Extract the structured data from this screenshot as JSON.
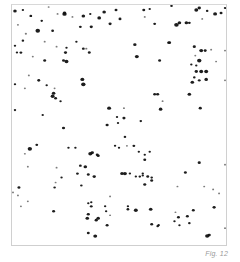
{
  "figure": {
    "caption": "Fig. 12",
    "colors": {
      "background": "#ffffff",
      "dots": "#111111",
      "frame": "#d0d0d0",
      "caption": "#9a9a9a"
    }
  },
  "dots": [
    [
      14,
      10,
      1.8
    ],
    [
      22,
      9,
      1.2
    ],
    [
      48,
      6,
      1.0
    ],
    [
      30,
      15,
      1.4
    ],
    [
      57,
      13,
      1.0
    ],
    [
      64,
      13,
      2.2
    ],
    [
      72,
      16,
      1.0
    ],
    [
      41,
      20,
      1.3
    ],
    [
      64,
      12,
      1.6
    ],
    [
      83,
      15,
      1.8
    ],
    [
      90,
      13,
      1.2
    ],
    [
      99,
      17,
      1.9
    ],
    [
      104,
      11,
      1.8
    ],
    [
      116,
      9,
      1.5
    ],
    [
      110,
      23,
      1.6
    ],
    [
      80,
      26,
      1.4
    ],
    [
      91,
      26,
      1.6
    ],
    [
      120,
      18,
      1.5
    ],
    [
      37,
      30,
      2.3
    ],
    [
      17,
      24,
      1.0
    ],
    [
      25,
      33,
      1.1
    ],
    [
      14,
      45,
      1.2
    ],
    [
      22,
      40,
      1.3
    ],
    [
      52,
      30,
      1.4
    ],
    [
      56,
      46,
      1.0
    ],
    [
      66,
      47,
      1.2
    ],
    [
      65,
      52,
      1.6
    ],
    [
      76,
      41,
      1.2
    ],
    [
      83,
      48,
      1.4
    ],
    [
      89,
      52,
      1.5
    ],
    [
      86,
      48,
      1.1
    ],
    [
      44,
      41,
      1.0
    ],
    [
      20,
      52,
      1.4
    ],
    [
      16,
      52,
      1.2
    ],
    [
      32,
      56,
      1.0
    ],
    [
      44,
      60,
      1.5
    ],
    [
      66,
      61,
      2.0
    ],
    [
      63,
      60,
      1.5
    ],
    [
      28,
      75,
      1.0
    ],
    [
      38,
      80,
      1.5
    ],
    [
      46,
      85,
      1.2
    ],
    [
      54,
      88,
      1.0
    ],
    [
      52,
      96,
      2.0
    ],
    [
      55,
      98,
      1.5
    ],
    [
      82,
      79,
      2.0
    ],
    [
      83,
      84,
      2.2
    ],
    [
      14,
      84,
      1.2
    ],
    [
      24,
      88,
      1.0
    ],
    [
      53,
      93,
      1.8
    ],
    [
      60,
      101,
      1.2
    ],
    [
      14,
      110,
      1.2
    ],
    [
      42,
      115,
      1.2
    ],
    [
      109,
      108,
      2.0
    ],
    [
      117,
      117,
      1.2
    ],
    [
      63,
      128,
      1.6
    ],
    [
      118,
      123,
      1.2
    ],
    [
      107,
      125,
      1.6
    ],
    [
      144,
      9,
      1.5
    ],
    [
      150,
      8,
      1.2
    ],
    [
      172,
      5,
      1.3
    ],
    [
      197,
      9,
      2.0
    ],
    [
      200,
      7,
      1.7
    ],
    [
      208,
      10,
      1.3
    ],
    [
      216,
      13,
      2.0
    ],
    [
      222,
      12,
      1.5
    ],
    [
      226,
      7,
      1.2
    ],
    [
      145,
      16,
      1.0
    ],
    [
      155,
      23,
      1.4
    ],
    [
      177,
      24,
      2.3
    ],
    [
      180,
      22,
      1.8
    ],
    [
      187,
      22,
      1.8
    ],
    [
      190,
      22,
      1.4
    ],
    [
      203,
      18,
      1.0
    ],
    [
      135,
      44,
      1.7
    ],
    [
      169,
      42,
      1.4
    ],
    [
      170,
      42,
      1.6
    ],
    [
      195,
      46,
      1.6
    ],
    [
      202,
      50,
      2.0
    ],
    [
      206,
      50,
      1.5
    ],
    [
      196,
      55,
      1.0
    ],
    [
      212,
      49,
      1.0
    ],
    [
      137,
      56,
      2.0
    ],
    [
      160,
      60,
      1.5
    ],
    [
      200,
      60,
      2.2
    ],
    [
      192,
      64,
      1.2
    ],
    [
      197,
      65,
      1.2
    ],
    [
      197,
      71,
      1.7
    ],
    [
      202,
      71,
      2.0
    ],
    [
      207,
      71,
      2.0
    ],
    [
      195,
      77,
      1.3
    ],
    [
      207,
      79,
      1.8
    ],
    [
      200,
      80,
      1.4
    ],
    [
      193,
      82,
      1.8
    ],
    [
      190,
      94,
      1.8
    ],
    [
      158,
      94,
      1.6
    ],
    [
      155,
      94,
      1.5
    ],
    [
      163,
      101,
      1.0
    ],
    [
      161,
      109,
      1.8
    ],
    [
      124,
      108,
      1.0
    ],
    [
      141,
      121,
      1.3
    ],
    [
      124,
      118,
      1.6
    ],
    [
      201,
      108,
      1.6
    ],
    [
      226,
      80,
      1.0
    ],
    [
      226,
      50,
      1.0
    ],
    [
      217,
      61,
      1.0
    ],
    [
      29,
      149,
      2.2
    ],
    [
      36,
      145,
      1.4
    ],
    [
      24,
      154,
      1.0
    ],
    [
      27,
      167,
      1.0
    ],
    [
      68,
      148,
      1.2
    ],
    [
      75,
      148,
      1.2
    ],
    [
      90,
      154,
      2.0
    ],
    [
      92,
      153,
      1.7
    ],
    [
      97,
      155,
      1.5
    ],
    [
      98,
      156,
      1.6
    ],
    [
      80,
      166,
      1.4
    ],
    [
      115,
      146,
      1.2
    ],
    [
      119,
      148,
      1.2
    ],
    [
      85,
      167,
      1.8
    ],
    [
      77,
      174,
      1.4
    ],
    [
      88,
      175,
      1.5
    ],
    [
      94,
      177,
      1.7
    ],
    [
      56,
      168,
      1.0
    ],
    [
      61,
      178,
      1.2
    ],
    [
      54,
      188,
      1.3
    ],
    [
      55,
      183,
      1.0
    ],
    [
      81,
      186,
      1.3
    ],
    [
      18,
      188,
      1.5
    ],
    [
      12,
      193,
      1.0
    ],
    [
      17,
      196,
      1.0
    ],
    [
      27,
      202,
      1.0
    ],
    [
      20,
      207,
      1.0
    ],
    [
      53,
      212,
      1.5
    ],
    [
      88,
      204,
      1.2
    ],
    [
      91,
      203,
      1.2
    ],
    [
      91,
      207,
      1.4
    ],
    [
      110,
      197,
      1.0
    ],
    [
      105,
      207,
      1.2
    ],
    [
      106,
      212,
      1.2
    ],
    [
      88,
      215,
      1.6
    ],
    [
      87,
      219,
      1.8
    ],
    [
      98,
      219,
      1.8
    ],
    [
      96,
      221,
      1.6
    ],
    [
      107,
      226,
      1.5
    ],
    [
      88,
      234,
      1.5
    ],
    [
      95,
      237,
      2.0
    ],
    [
      110,
      216,
      1.0
    ],
    [
      125,
      137,
      1.3
    ],
    [
      127,
      146,
      1.0
    ],
    [
      134,
      146,
      1.4
    ],
    [
      139,
      152,
      1.2
    ],
    [
      145,
      155,
      1.2
    ],
    [
      150,
      152,
      1.2
    ],
    [
      145,
      160,
      1.5
    ],
    [
      125,
      174,
      2.0
    ],
    [
      122,
      174,
      1.8
    ],
    [
      130,
      174,
      1.2
    ],
    [
      143,
      174,
      1.2
    ],
    [
      136,
      177,
      1.2
    ],
    [
      143,
      176,
      1.2
    ],
    [
      140,
      177,
      1.3
    ],
    [
      148,
      177,
      1.5
    ],
    [
      152,
      178,
      1.3
    ],
    [
      152,
      181,
      1.5
    ],
    [
      145,
      185,
      1.6
    ],
    [
      200,
      163,
      1.6
    ],
    [
      186,
      173,
      1.5
    ],
    [
      178,
      187,
      1.0
    ],
    [
      205,
      187,
      1.0
    ],
    [
      214,
      190,
      1.0
    ],
    [
      220,
      194,
      1.0
    ],
    [
      128,
      210,
      1.4
    ],
    [
      128,
      207,
      1.2
    ],
    [
      136,
      211,
      2.0
    ],
    [
      151,
      210,
      1.8
    ],
    [
      176,
      213,
      1.0
    ],
    [
      179,
      218,
      1.5
    ],
    [
      194,
      211,
      1.5
    ],
    [
      188,
      217,
      1.5
    ],
    [
      215,
      208,
      1.6
    ],
    [
      190,
      224,
      1.3
    ],
    [
      152,
      225,
      1.5
    ],
    [
      159,
      226,
      1.3
    ],
    [
      158,
      227,
      1.3
    ],
    [
      175,
      222,
      1.2
    ],
    [
      180,
      226,
      1.2
    ],
    [
      208,
      237,
      2.1
    ],
    [
      210,
      236,
      1.7
    ],
    [
      226,
      229,
      1.0
    ],
    [
      226,
      165,
      1.0
    ]
  ]
}
